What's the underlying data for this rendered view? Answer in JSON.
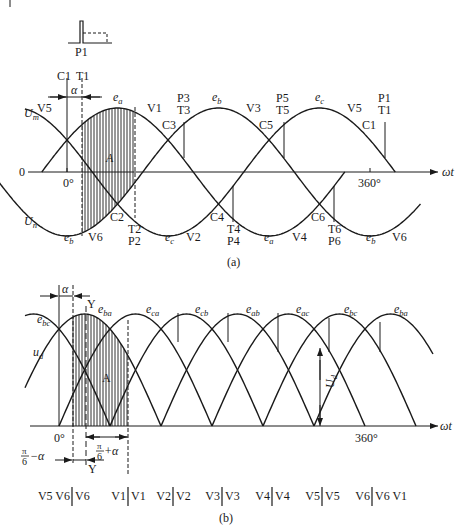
{
  "figure_a": {
    "caption": "(a)",
    "pulse_label": "P1",
    "axis": {
      "origin_label": "0",
      "zero_deg": "0°",
      "full_deg": "360°",
      "x_label": "ωt"
    },
    "upper_envelope_label": {
      "main": "U",
      "sub": "m"
    },
    "lower_envelope_label": {
      "main": "U",
      "sub": "n"
    },
    "area_label": "A",
    "alpha_label": "α",
    "top_markers": [
      {
        "id": "C1",
        "text": "C1"
      },
      {
        "id": "T1",
        "text": "T1"
      }
    ],
    "upper_labels": [
      {
        "text": "V5"
      },
      {
        "text": "V1"
      },
      {
        "text": "C3"
      },
      {
        "text": "P3"
      },
      {
        "text": "T3"
      },
      {
        "text": "V3"
      },
      {
        "text": "C5"
      },
      {
        "text": "P5"
      },
      {
        "text": "T5"
      },
      {
        "text": "V5"
      },
      {
        "text": "C1"
      },
      {
        "text": "P1"
      },
      {
        "text": "T1"
      }
    ],
    "lower_labels": [
      {
        "text": "C2"
      },
      {
        "text": "V6"
      },
      {
        "text": "T2"
      },
      {
        "text": "P2"
      },
      {
        "text": "V2"
      },
      {
        "text": "C4"
      },
      {
        "text": "T4"
      },
      {
        "text": "P4"
      },
      {
        "text": "V4"
      },
      {
        "text": "C6"
      },
      {
        "text": "T6"
      },
      {
        "text": "P6"
      },
      {
        "text": "V6"
      }
    ],
    "phase_labels": {
      "ea_top": {
        "main": "e",
        "sub": "a"
      },
      "eb_top": {
        "main": "e",
        "sub": "b"
      },
      "ec_top": {
        "main": "e",
        "sub": "c"
      },
      "eb_bot1": {
        "main": "e",
        "sub": "b"
      },
      "ec_bot": {
        "main": "e",
        "sub": "c"
      },
      "ea_bot": {
        "main": "e",
        "sub": "a"
      },
      "eb_bot2": {
        "main": "e",
        "sub": "b"
      }
    }
  },
  "figure_b": {
    "caption": "(b)",
    "axis": {
      "zero_deg": "0°",
      "full_deg": "360°",
      "x_label": "ωt"
    },
    "output_label": {
      "main": "u",
      "sub": "d"
    },
    "avg_label": {
      "main": "U",
      "sub": "d"
    },
    "area_label": "A",
    "alpha_label": "α",
    "y_label_top": "Y",
    "y_label_bottom": "Y",
    "pi6_minus_alpha": {
      "num": "π",
      "den": "6",
      "rest": "−α"
    },
    "pi6_plus_alpha": {
      "num": "π",
      "den": "6",
      "rest": "+α"
    },
    "phase_labels": [
      {
        "main": "e",
        "sub": "bc"
      },
      {
        "main": "e",
        "sub": "ba"
      },
      {
        "main": "e",
        "sub": "ca"
      },
      {
        "main": "e",
        "sub": "cb"
      },
      {
        "main": "e",
        "sub": "ab"
      },
      {
        "main": "e",
        "sub": "ac"
      },
      {
        "main": "e",
        "sub": "bc"
      },
      {
        "main": "e",
        "sub": "ba"
      }
    ],
    "conduction_sequence": [
      {
        "left": "V5 V6",
        "right": "V6"
      },
      {
        "left": "V1",
        "right": "V1"
      },
      {
        "left": "V2",
        "right": "V2"
      },
      {
        "left": "V3",
        "right": "V3"
      },
      {
        "left": "V4",
        "right": "V4"
      },
      {
        "left": "V5",
        "right": "V5"
      },
      {
        "left": "V6",
        "right": "V6 V1"
      }
    ]
  }
}
